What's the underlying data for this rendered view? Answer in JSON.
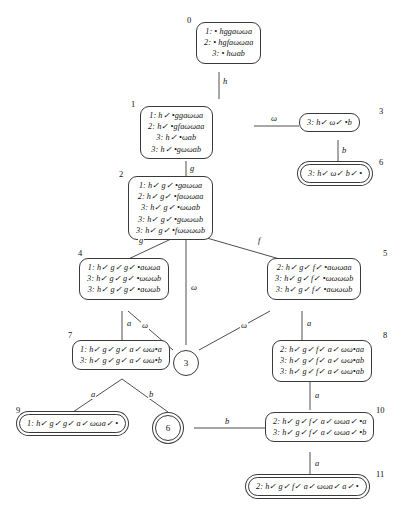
{
  "diagram": {
    "type": "tableau-derivation-tree",
    "nodes": [
      {
        "id": "0",
        "label": "0",
        "accepting": false,
        "lines": [
          "1: • hggaωωa",
          "2: • hgfaωωaa",
          "3: • hωab"
        ]
      },
      {
        "id": "1",
        "label": "1",
        "accepting": false,
        "lines": [
          "1: h✓ •ggaωωa",
          "2: h✓ •gfaωωaa",
          "3: h✓ •ωab",
          "3: h✓ •gωωab"
        ]
      },
      {
        "id": "2",
        "label": "2",
        "accepting": false,
        "lines": [
          "1: h✓ g✓ •gaωωa",
          "2: h✓ g✓ •faωωaa",
          "3: h✓ g✓ •ωωab",
          "3: h✓ g✓ •gωωωb",
          "3: h✓ g✓ •fωωωωb"
        ]
      },
      {
        "id": "3",
        "label": "3",
        "accepting": false,
        "lines": [
          "3: h✓ ω✓ •b"
        ]
      },
      {
        "id": "4",
        "label": "4",
        "accepting": false,
        "lines": [
          "1: h✓ g✓ g✓ •aωωa",
          "3: h✓ g✓ g✓ •ωωωb",
          "3: h✓ g✓ g✓ •aωωb"
        ]
      },
      {
        "id": "5",
        "label": "5",
        "accepting": false,
        "lines": [
          "2: h✓ g✓ f✓ •aωωaa",
          "3: h✓ g✓ f✓ •ωωωωb",
          "3: h✓ g✓ f✓ •aωωωb"
        ]
      },
      {
        "id": "6",
        "label": "6",
        "accepting": true,
        "lines": [
          "3: h✓ ω✓ b✓ •"
        ]
      },
      {
        "id": "7",
        "label": "7",
        "accepting": false,
        "lines": [
          "1: h✓ g✓ g✓ a✓ ωω•a",
          "3: h✓ g✓ g✓ a✓ ωω•b"
        ]
      },
      {
        "id": "8",
        "label": "8",
        "accepting": false,
        "lines": [
          "2: h✓ g✓ f✓ a✓ ωω•aa",
          "3: h✓ g✓ f✓ a✓ ωω•ab",
          "3: h✓ g✓ f✓ a✓ ωω•ab"
        ]
      },
      {
        "id": "9",
        "label": "9",
        "accepting": true,
        "lines": [
          "1: h✓ g✓ g✓ a✓ ωωa✓ •"
        ]
      },
      {
        "id": "10",
        "label": "10",
        "accepting": false,
        "lines": [
          "2: h✓ g✓ f✓ a✓ ωωa✓ •a",
          "3: h✓ g✓ f✓ a✓ ωωa✓ •b"
        ]
      },
      {
        "id": "11",
        "label": "11",
        "accepting": true,
        "lines": [
          "2: h✓ g✓ f✓ a✓ ωωa✓ a✓ •"
        ]
      }
    ],
    "circle_refs": [
      {
        "id": "ref3",
        "label": "3",
        "accepting": false
      },
      {
        "id": "ref6",
        "label": "6",
        "accepting": true
      }
    ],
    "edge_labels": [
      {
        "id": "e0_1",
        "label": "h"
      },
      {
        "id": "e1_2",
        "label": "g"
      },
      {
        "id": "e1_3",
        "label": "ω"
      },
      {
        "id": "e3_6",
        "label": "b"
      },
      {
        "id": "e2_4",
        "label": "g"
      },
      {
        "id": "e2_5",
        "label": "f"
      },
      {
        "id": "e2_ref3",
        "label": "ω"
      },
      {
        "id": "e4_ref3",
        "label": "ω"
      },
      {
        "id": "e5_ref3",
        "label": "ω"
      },
      {
        "id": "e4_7",
        "label": "a"
      },
      {
        "id": "e5_8",
        "label": "a"
      },
      {
        "id": "e7_9",
        "label": "a"
      },
      {
        "id": "e7_ref6",
        "label": "b"
      },
      {
        "id": "e8_10",
        "label": "a"
      },
      {
        "id": "e10_ref6",
        "label": "b"
      },
      {
        "id": "e10_11",
        "label": "a"
      }
    ]
  },
  "colors": {
    "stroke": "#3a3a3a",
    "text": "#121212",
    "background": "#ffffff"
  }
}
